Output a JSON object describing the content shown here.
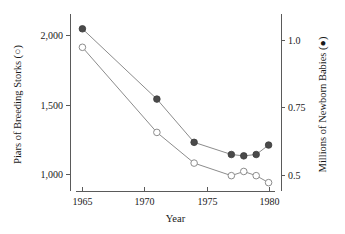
{
  "chart_data": {
    "type": "line",
    "title": "",
    "xlabel": "Year",
    "x": [
      1965,
      1971,
      1974,
      1977,
      1978,
      1979,
      1980
    ],
    "xlim": [
      1964,
      1981
    ],
    "xticks": [
      1965,
      1970,
      1975,
      1980
    ],
    "xticklabels": [
      "1965",
      "1970",
      "1975",
      "1980"
    ],
    "grid": false,
    "legend": "none (marker glyphs embedded in axis titles)",
    "axes": {
      "left": {
        "label": "Piars of Breeding Storks (○)",
        "marker": "open-circle",
        "ylim": [
          880,
          2120
        ],
        "yticks": [
          1000,
          1500,
          2000
        ],
        "yticklabels": [
          "1,000",
          "1,500",
          "2,000"
        ]
      },
      "right": {
        "label": "Millions of Newborn Babies (●)",
        "marker": "filled-circle",
        "ylim": [
          0.44,
          1.08
        ],
        "yticks": [
          0.5,
          0.75,
          1.0
        ],
        "yticklabels": [
          "0.5",
          "0.75",
          "1.0"
        ]
      }
    },
    "series": [
      {
        "name": "Piars of Breeding Storks",
        "axis": "left",
        "marker": "open-circle",
        "color": "#8c8c8c",
        "values": [
          1910,
          1300,
          1080,
          990,
          1020,
          990,
          940
        ]
      },
      {
        "name": "Millions of Newborn Babies",
        "axis": "right",
        "marker": "filled-circle",
        "color": "#4a4a4a",
        "values": [
          1.04,
          0.78,
          0.62,
          0.575,
          0.57,
          0.575,
          0.61
        ]
      }
    ]
  }
}
